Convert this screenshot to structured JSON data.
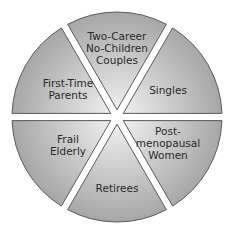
{
  "diagram": {
    "type": "segmented-circle",
    "segments": [
      {
        "id": "two-career",
        "lines": [
          "Two-Career",
          "No-Children",
          "Couples"
        ]
      },
      {
        "id": "singles",
        "lines": [
          "Singles"
        ]
      },
      {
        "id": "postmenopausal",
        "lines": [
          "Post-",
          "menopausal",
          "Women"
        ]
      },
      {
        "id": "retirees",
        "lines": [
          "Retirees"
        ]
      },
      {
        "id": "frail-elderly",
        "lines": [
          "Frail",
          "Elderly"
        ]
      },
      {
        "id": "first-time-parents",
        "lines": [
          "First-Time",
          "Parents"
        ]
      }
    ],
    "colors": {
      "fill_outer": "#a9a9a9",
      "fill_inner": "#f2f2f2",
      "stroke": "#5a5a5a"
    }
  }
}
